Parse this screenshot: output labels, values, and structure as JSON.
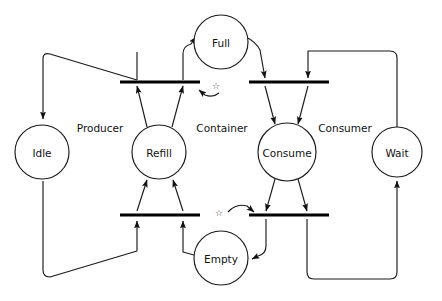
{
  "diagram": {
    "type": "petri-net",
    "background_color": "#ffffff",
    "line_color": "#1a1a1a",
    "bar_color": "#000000",
    "text_color": "#111111"
  },
  "places": [
    {
      "id": "full",
      "label": "Full",
      "cx": 221,
      "cy": 42,
      "r": 27
    },
    {
      "id": "idle",
      "label": "Idle",
      "cx": 42,
      "cy": 152,
      "r": 27
    },
    {
      "id": "refill",
      "label": "Refill",
      "cx": 159,
      "cy": 152,
      "r": 27
    },
    {
      "id": "consume",
      "label": "Consume",
      "cx": 287,
      "cy": 152,
      "r": 29
    },
    {
      "id": "wait",
      "label": "Wait",
      "cx": 397,
      "cy": 152,
      "r": 25
    },
    {
      "id": "empty",
      "label": "Empty",
      "cx": 221,
      "cy": 258,
      "r": 27
    }
  ],
  "transitions": [
    {
      "id": "t-producer-start",
      "x1": 120,
      "x2": 200,
      "y": 82
    },
    {
      "id": "t-consumer-start",
      "x1": 249,
      "x2": 329,
      "y": 82
    },
    {
      "id": "t-producer-finish",
      "x1": 120,
      "x2": 200,
      "y": 215
    },
    {
      "id": "t-consumer-finish",
      "x1": 249,
      "x2": 329,
      "y": 215
    }
  ],
  "group_labels": [
    {
      "id": "producer",
      "label": "Producer",
      "x": 100,
      "y": 128
    },
    {
      "id": "container",
      "label": "Container",
      "x": 222,
      "y": 128
    },
    {
      "id": "consumer",
      "label": "Consumer",
      "x": 345,
      "y": 128
    }
  ],
  "tokens": [
    {
      "id": "token-upper",
      "symbol": "☆",
      "x": 216,
      "y": 86
    },
    {
      "id": "token-lower",
      "symbol": "☆",
      "x": 219,
      "y": 213
    }
  ],
  "arc_count": 16,
  "legend": {
    "place_shape": "circle",
    "transition_shape": "bar",
    "arc_shape": "arrow"
  }
}
